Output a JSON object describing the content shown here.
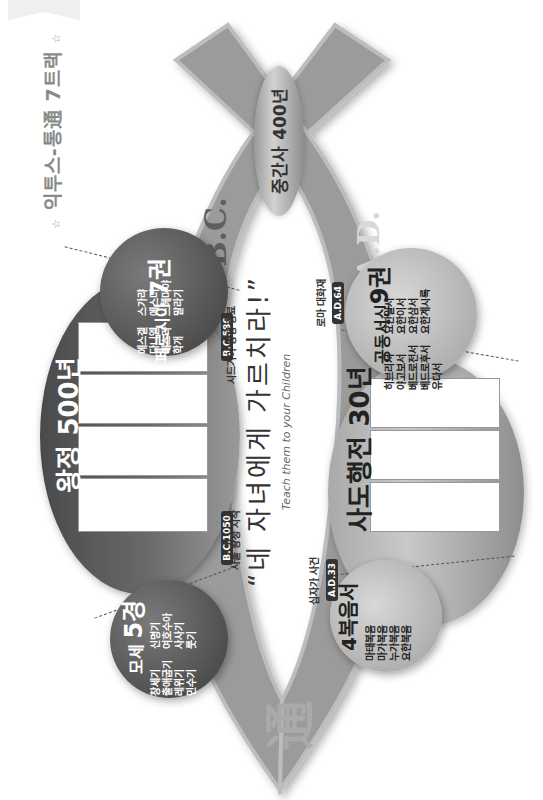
{
  "title": {
    "text": "익투스-통通 7트랙",
    "star_left": "☆",
    "star_right": "☆"
  },
  "bands": {
    "bc_label": "B.C.",
    "ad_label": "A.D.",
    "tong_char": "通",
    "band_color": "#9b9b9b",
    "band_edge_color": "#bdbdbd"
  },
  "intertestament": {
    "label": "중간사 400년"
  },
  "old_testament": {
    "moses": {
      "title": "모세",
      "count": "5경",
      "books": [
        [
          "창세기",
          "출애굽기",
          "레위기",
          "민수기"
        ],
        [
          "신명기",
          "여호수아",
          "사사기",
          "룻기"
        ]
      ]
    },
    "kingdom": {
      "title": "왕정",
      "count": "500년",
      "panels": 4,
      "start_date": "B.C.1050",
      "start_event": "사울 왕정 시작",
      "end_date": "B.C.586",
      "end_event": "시드기야 왕정 종료"
    },
    "persia": {
      "title": "페르시아",
      "count": "7권",
      "books": [
        [
          "에스겔",
          "다니엘",
          "에스라",
          "학개"
        ],
        [
          "스가랴",
          "에스더",
          "느헤미야",
          "말라기"
        ]
      ]
    }
  },
  "new_testament": {
    "gospels": {
      "title": "4복음서",
      "books": [
        "마태복음",
        "마가복음",
        "누가복음",
        "요한복음"
      ]
    },
    "acts": {
      "title": "사도행전",
      "count": "30년",
      "panels": 3,
      "start_date": "A.D.33",
      "start_event": "십자가 사건",
      "end_date": "A.D.64",
      "end_event": "로마 대화재"
    },
    "epistles": {
      "title": "공동서신",
      "count": "9권",
      "books": [
        [
          "히브리서",
          "야고보서",
          "베드로전서",
          "베드로후서",
          "유다서"
        ],
        [
          "요한일서",
          "요한이서",
          "요한삼서",
          "요한계시록"
        ]
      ]
    }
  },
  "quote": {
    "main_open": "“",
    "main": "네 자녀에게 가르치라!",
    "main_close": "”",
    "sub": "Teach them to your Children"
  }
}
